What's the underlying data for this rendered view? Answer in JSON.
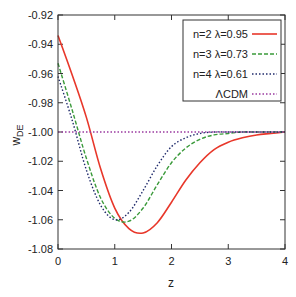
{
  "chart_data": {
    "type": "line",
    "title": "",
    "xlabel": "z",
    "ylabel": "w_DE",
    "xlim": [
      0,
      4
    ],
    "ylim": [
      -1.08,
      -0.92
    ],
    "grid": false,
    "legend_position": "upper right (inside)",
    "x_ticks": [
      "0",
      "1",
      "2",
      "3",
      "4"
    ],
    "y_ticks": [
      "-0.92",
      "-0.94",
      "-0.96",
      "-0.98",
      "-1.00",
      "-1.02",
      "-1.04",
      "-1.06",
      "-1.08"
    ],
    "x": [
      0,
      0.25,
      0.5,
      0.75,
      1.0,
      1.25,
      1.5,
      1.75,
      2.0,
      2.25,
      2.5,
      2.75,
      3.0,
      3.25,
      3.5,
      3.75,
      4.0
    ],
    "series": [
      {
        "name": "n=2 λ=0.95",
        "color": "#e8372a",
        "style": "solid",
        "values": [
          -0.934,
          -0.961,
          -0.99,
          -1.025,
          -1.052,
          -1.066,
          -1.069,
          -1.062,
          -1.048,
          -1.033,
          -1.021,
          -1.012,
          -1.007,
          -1.004,
          -1.002,
          -1.001,
          -1.0
        ]
      },
      {
        "name": "n=3 λ=0.73",
        "color": "#3a9a3a",
        "style": "dashed",
        "values": [
          -0.953,
          -0.985,
          -1.018,
          -1.045,
          -1.059,
          -1.061,
          -1.052,
          -1.036,
          -1.021,
          -1.011,
          -1.005,
          -1.002,
          -1.001,
          -1.0,
          -1.0,
          -1.0,
          -1.0
        ]
      },
      {
        "name": "n=4 λ=0.61",
        "color": "#1f2a6b",
        "style": "dotted",
        "values": [
          -0.962,
          -0.992,
          -1.026,
          -1.05,
          -1.06,
          -1.055,
          -1.04,
          -1.023,
          -1.01,
          -1.004,
          -1.001,
          -1.0,
          -1.0,
          -1.0,
          -1.0,
          -1.0,
          -1.0
        ]
      },
      {
        "name": "ΛCDM",
        "color": "#9a3aa0",
        "style": "dotted",
        "values": [
          -1.0,
          -1.0,
          -1.0,
          -1.0,
          -1.0,
          -1.0,
          -1.0,
          -1.0,
          -1.0,
          -1.0,
          -1.0,
          -1.0,
          -1.0,
          -1.0,
          -1.0,
          -1.0,
          -1.0
        ]
      }
    ]
  },
  "labels": {
    "xlabel": "z",
    "ylabel_main": "w",
    "ylabel_sub": "DE",
    "legend": [
      "n=2 λ=0.95",
      "n=3 λ=0.73",
      "n=4 λ=0.61",
      "ΛCDM"
    ]
  }
}
